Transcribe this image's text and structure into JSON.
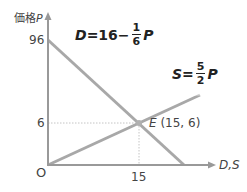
{
  "axes": {
    "y_label_prefix": "価格",
    "y_label_var": "P",
    "x_label": "D,S",
    "origin_label": "O",
    "y_ticks": [
      "96",
      "6"
    ],
    "x_ticks": [
      "15"
    ]
  },
  "demand": {
    "lhs": "D",
    "eq_sign": "=16−",
    "frac_num": "1",
    "frac_den": "6",
    "var": "P"
  },
  "supply": {
    "lhs": "S",
    "eq_sign": "=",
    "frac_num": "5",
    "frac_den": "2",
    "var": "P"
  },
  "equilibrium": {
    "label": "E",
    "coords": "(15, 6)"
  },
  "colors": {
    "line": "#a8a8a8",
    "axis": "#999999",
    "dotted": "#c8c8c8"
  }
}
